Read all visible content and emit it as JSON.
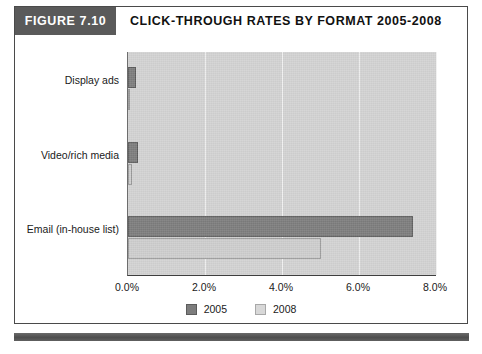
{
  "figure": {
    "tag": "FIGURE 7.10",
    "title": "CLICK-THROUGH RATES BY FORMAT 2005-2008"
  },
  "colors": {
    "tag_background": "#5a5a5a",
    "plot_background": "#d3d3d3",
    "series_2005": "#7d7d7d",
    "series_2008": "#cecece",
    "gridline": "#f1f1f1",
    "axis": "#3f3f3f",
    "footer_bar": "#555555"
  },
  "chart_data": {
    "type": "bar",
    "orientation": "horizontal",
    "title": "CLICK-THROUGH RATES BY FORMAT 2005-2008",
    "xlabel": "",
    "ylabel": "",
    "categories": [
      "Display ads",
      "Video/rich media",
      "Email (in-house list)"
    ],
    "series": [
      {
        "name": "2005",
        "values": [
          0.2,
          0.25,
          7.4
        ]
      },
      {
        "name": "2008",
        "values": [
          0.05,
          0.1,
          5.0
        ]
      }
    ],
    "xlim": [
      0.0,
      8.0
    ],
    "xticks": [
      0.0,
      2.0,
      4.0,
      6.0,
      8.0
    ],
    "xtick_labels": [
      "0.0%",
      "2.0%",
      "4.0%",
      "6.0%",
      "8.0%"
    ],
    "grid": "vertical",
    "legend_position": "bottom",
    "legend": [
      "2005",
      "2008"
    ]
  }
}
